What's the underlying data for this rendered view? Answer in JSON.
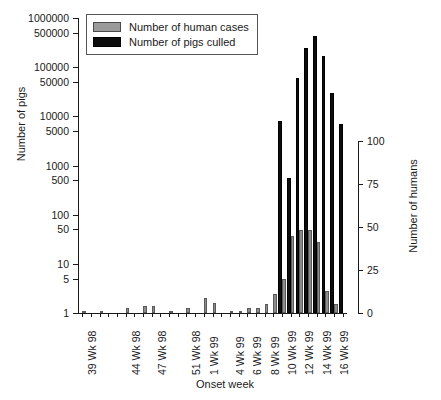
{
  "chart_data": {
    "type": "bar",
    "title": "",
    "xlabel": "Onset week",
    "ylabel": "Number of pigs",
    "ylabel_right": "Number of humans",
    "grid": false,
    "legend_position": "top-left",
    "yscale": "log",
    "ylim": [
      1,
      1000000
    ],
    "yticks": [
      1,
      5,
      10,
      50,
      100,
      500,
      1000,
      5000,
      10000,
      50000,
      100000,
      500000,
      1000000
    ],
    "ytick_labels": [
      "1",
      "5",
      "10",
      "50",
      "100",
      "500",
      "1000",
      "5000",
      "10000",
      "50000",
      "100000",
      "500000",
      "1000000"
    ],
    "yscale_right": "linear",
    "ylim_right": [
      0,
      100
    ],
    "yticks_right": [
      0,
      25,
      50,
      75,
      100
    ],
    "ytick_labels_right": [
      "0",
      "25",
      "50",
      "75",
      "100"
    ],
    "categories": [
      "39 Wk 98",
      "40 Wk 98",
      "41 Wk 98",
      "42 Wk 98",
      "43 Wk 98",
      "44 Wk 98",
      "45 Wk 98",
      "46 Wk 98",
      "47 Wk 98",
      "48 Wk 98",
      "49 Wk 98",
      "50 Wk 98",
      "51 Wk 98",
      "52 Wk 98",
      "1 Wk 99",
      "2 Wk 99",
      "3 Wk 99",
      "4 Wk 99",
      "5 Wk 99",
      "6 Wk 99",
      "7 Wk 99",
      "8 Wk 99",
      "9 Wk 99",
      "10 Wk 99",
      "11 Wk 99",
      "12 Wk 99",
      "13 Wk 99",
      "14 Wk 99",
      "15 Wk 99",
      "16 Wk 99",
      "17 Wk 99"
    ],
    "xtick_labels": [
      "39 Wk 98",
      "",
      "",
      "",
      "",
      "44 Wk 98",
      "",
      "",
      "47 Wk 98",
      "",
      "",
      "",
      "51 Wk 98",
      "",
      "1 Wk 99",
      "",
      "",
      "4 Wk 99",
      "",
      "6 Wk 99",
      "",
      "8 Wk 99",
      "",
      "10 Wk 99",
      "",
      "12 Wk 99",
      "",
      "14 Wk 99",
      "",
      "16 Wk 99",
      ""
    ],
    "series": [
      {
        "name": "Number of human cases",
        "axis": "right",
        "color": "#8c8c8c",
        "values": [
          1,
          0,
          1,
          0,
          0,
          3,
          0,
          4,
          4,
          0,
          1,
          0,
          3,
          0,
          9,
          6,
          0,
          1,
          1,
          3,
          3,
          5,
          11,
          20,
          45,
          48,
          48,
          41,
          13,
          5,
          0
        ]
      },
      {
        "name": "Number of pigs culled",
        "axis": "left",
        "color": "#0d0d0d",
        "values": [
          0,
          0,
          0,
          0,
          0,
          0,
          0,
          0,
          0,
          0,
          0,
          0,
          0,
          0,
          0,
          0,
          0,
          0,
          0,
          0,
          0,
          0,
          0,
          8000,
          550,
          60000,
          250000,
          430000,
          170000,
          30000,
          7000
        ]
      }
    ]
  },
  "legend": {
    "items": [
      {
        "label": "Number of human cases",
        "swatch": "gray-swatch"
      },
      {
        "label": "Number of pigs culled",
        "swatch": "black-swatch"
      }
    ]
  }
}
